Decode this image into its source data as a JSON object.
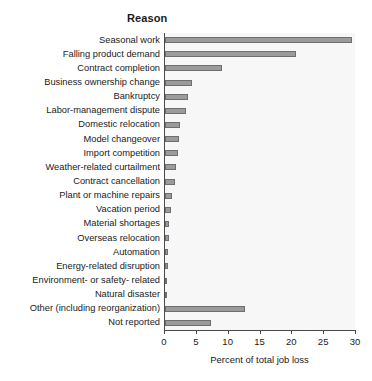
{
  "chart_data": {
    "type": "bar",
    "orientation": "horizontal",
    "title": "Reason",
    "xlabel": "Percent of total job loss",
    "ylabel": "",
    "xlim": [
      0,
      30
    ],
    "xticks": [
      0,
      5,
      10,
      15,
      20,
      25,
      30
    ],
    "grid": false,
    "legend": null,
    "bar_color": "#9b9b9b",
    "bar_edge_color": "#6e6e6e",
    "plot_background": "#f7f7f7",
    "categories": [
      "Seasonal work",
      "Falling product demand",
      "Contract completion",
      "Business ownership change",
      "Bankruptcy",
      "Labor-management dispute",
      "Domestic relocation",
      "Model changeover",
      "Import competition",
      "Weather-related curtailment",
      "Contract cancellation",
      "Plant or machine repairs",
      "Vacation period",
      "Material shortages",
      "Overseas relocation",
      "Automation",
      "Energy-related disruption",
      "Environment- or safety- related",
      "Natural disaster",
      "Other (including reorganization)",
      "Not reported"
    ],
    "values": [
      29.4,
      20.5,
      9.0,
      4.2,
      3.6,
      3.3,
      2.3,
      2.2,
      2.1,
      1.7,
      1.5,
      1.1,
      0.9,
      0.7,
      0.6,
      0.5,
      0.4,
      0.35,
      0.3,
      12.6,
      7.3
    ]
  }
}
